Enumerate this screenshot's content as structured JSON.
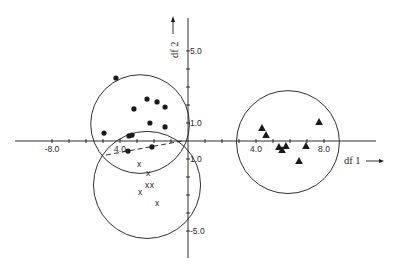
{
  "chart_data": {
    "type": "scatter",
    "title": "",
    "xlabel": "df 1",
    "ylabel": "df 2",
    "xlim": [
      -10.0,
      11.0
    ],
    "ylim": [
      -6.5,
      7.0
    ],
    "grid": false,
    "legend": null,
    "x_tick_labels": [
      {
        "value": -8.0,
        "label": "-8.0"
      },
      {
        "value": -4.0,
        "label": "4.0"
      },
      {
        "value": 4.0,
        "label": "4.0"
      },
      {
        "value": 8.0,
        "label": "8.0"
      }
    ],
    "y_tick_labels": [
      {
        "value": 5.0,
        "label": "5.0"
      },
      {
        "value": 1.0,
        "label": "1.0"
      },
      {
        "value": -1.0,
        "label": "1.0"
      },
      {
        "value": -5.0,
        "label": "-5.0"
      }
    ],
    "x_minor_ticks": [
      -8,
      -7,
      -6,
      -5,
      -4,
      -3,
      -2,
      -1,
      1,
      2,
      3,
      4,
      5,
      6,
      7,
      8
    ],
    "y_minor_ticks": [
      5,
      4,
      3,
      2,
      1,
      -1,
      -2,
      -3,
      -4,
      -5
    ],
    "series": [
      {
        "name": "group-dots",
        "marker": "circle-filled",
        "points": [
          [
            -4.24,
            3.5
          ],
          [
            -2.41,
            2.33
          ],
          [
            -1.82,
            2.17
          ],
          [
            -1.35,
            1.89
          ],
          [
            -3.18,
            1.78
          ],
          [
            -2.24,
            1.0
          ],
          [
            -1.35,
            0.78
          ],
          [
            -4.94,
            0.44
          ],
          [
            -3.47,
            0.28
          ],
          [
            -3.29,
            0.33
          ],
          [
            -3.53,
            -0.56
          ],
          [
            -2.12,
            -0.33
          ]
        ],
        "circle": {
          "cx": -2.82,
          "cy": 0.94,
          "r": 2.82
        }
      },
      {
        "name": "group-crosses",
        "marker": "x",
        "points": [
          [
            -2.88,
            -1.28
          ],
          [
            -2.35,
            -1.78
          ],
          [
            -2.41,
            -2.44
          ],
          [
            -2.12,
            -2.44
          ],
          [
            -2.82,
            -2.83
          ],
          [
            -1.82,
            -3.44
          ]
        ],
        "circle": {
          "cx": -2.41,
          "cy": -2.44,
          "r": 3.06
        }
      },
      {
        "name": "group-triangles",
        "marker": "triangle-filled",
        "points": [
          [
            4.35,
            0.72
          ],
          [
            4.59,
            0.33
          ],
          [
            7.71,
            1.06
          ],
          [
            5.35,
            -0.33
          ],
          [
            5.53,
            -0.5
          ],
          [
            5.76,
            -0.28
          ],
          [
            6.94,
            -0.28
          ],
          [
            6.53,
            -1.11
          ]
        ],
        "circle": {
          "cx": 5.88,
          "cy": -0.06,
          "r": 2.94
        }
      }
    ],
    "annotations": [
      {
        "type": "dashed-line",
        "from": [
          -4.82,
          -0.78
        ],
        "to": [
          -0.35,
          0.0
        ]
      }
    ]
  },
  "axes": {
    "x_title": "df 1",
    "y_title": "df 2",
    "arrow": "→"
  },
  "colors": {
    "ink": "#1a1a1a",
    "background": "#ffffff"
  }
}
